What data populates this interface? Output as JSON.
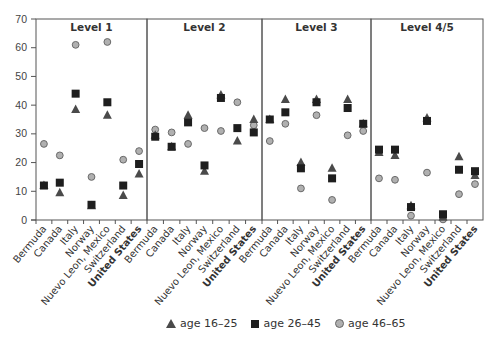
{
  "chart_data": {
    "type": "scatter",
    "title": "",
    "xlabel": "",
    "ylabel": "",
    "ylim": [
      0,
      70
    ],
    "yticks": [
      0,
      10,
      20,
      30,
      40,
      50,
      60,
      70
    ],
    "grid": false,
    "legend_position": "bottom",
    "categories": [
      "Bermuda",
      "Canada",
      "Italy",
      "Norway",
      "Nuevo Leon, Mexico",
      "Switzerland",
      "United States"
    ],
    "bold_categories": [
      "United States"
    ],
    "series_styles": [
      {
        "name": "age 16–25",
        "marker": "triangle",
        "color": "#4a4a4a"
      },
      {
        "name": "age 26–45",
        "marker": "square",
        "color": "#1e1e1e"
      },
      {
        "name": "age 46–65",
        "marker": "circle",
        "color": "#b0b0b0"
      }
    ],
    "panels": [
      {
        "title": "Level 1",
        "series": [
          {
            "name": "age 16–25",
            "values": [
              12,
              9.5,
              38.5,
              5,
              36.5,
              8.5,
              16
            ]
          },
          {
            "name": "age 26–45",
            "values": [
              12,
              13,
              44,
              5.3,
              41,
              12,
              19.5
            ]
          },
          {
            "name": "age 46–65",
            "values": [
              26.5,
              22.5,
              61,
              15,
              62,
              21,
              24
            ]
          }
        ]
      },
      {
        "title": "Level 2",
        "series": [
          {
            "name": "age 16–25",
            "values": [
              29.5,
              25.5,
              36.5,
              17,
              43.5,
              27.5,
              35
            ]
          },
          {
            "name": "age 26–45",
            "values": [
              29,
              25.5,
              34,
              19,
              42.5,
              32,
              30.5
            ]
          },
          {
            "name": "age 46–65",
            "values": [
              31.5,
              30.5,
              26.5,
              32,
              31,
              41,
              33
            ]
          }
        ]
      },
      {
        "title": "Level 3",
        "series": [
          {
            "name": "age 16–25",
            "values": [
              35,
              42,
              20,
              42,
              18,
              42,
              33.5
            ]
          },
          {
            "name": "age 26–45",
            "values": [
              35,
              37.5,
              18,
              41,
              14.5,
              39,
              33.5
            ]
          },
          {
            "name": "age 46–65",
            "values": [
              27.5,
              33.5,
              11,
              36.5,
              7,
              29.5,
              31
            ]
          }
        ]
      },
      {
        "title": "Level 4/5",
        "series": [
          {
            "name": "age 16–25",
            "values": [
              23.5,
              22.5,
              5,
              35.5,
              1,
              22,
              15.5
            ]
          },
          {
            "name": "age 26–45",
            "values": [
              24.5,
              24.5,
              4.5,
              34.5,
              2,
              17.5,
              17
            ]
          },
          {
            "name": "age 46–65",
            "values": [
              14.5,
              14,
              1.5,
              16.5,
              0.2,
              9,
              12.5
            ]
          }
        ]
      }
    ]
  },
  "legend": {
    "items": [
      {
        "label": "age 16–25"
      },
      {
        "label": "age 26–45"
      },
      {
        "label": "age 46–65"
      }
    ]
  }
}
